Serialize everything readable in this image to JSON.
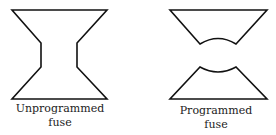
{
  "figure": {
    "left": {
      "label_line1": "Unprogrammed",
      "label_line2": "fuse"
    },
    "right": {
      "label_line1": "Programmed",
      "label_line2": "fuse"
    },
    "stroke_color": "#111111"
  }
}
